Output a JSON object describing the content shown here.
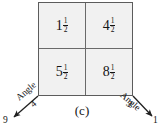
{
  "figure": {
    "caption": "(c)",
    "grid": {
      "rows": [
        [
          {
            "whole": "1",
            "numerator": "1",
            "denominator": "2"
          },
          {
            "whole": "4",
            "numerator": "1",
            "denominator": "2"
          }
        ],
        [
          {
            "whole": "5",
            "numerator": "1",
            "denominator": "2"
          },
          {
            "whole": "8",
            "numerator": "1",
            "denominator": "2"
          }
        ]
      ]
    },
    "axes": {
      "left": {
        "label": "Angle",
        "near_value": "4",
        "far_value": "9"
      },
      "right": {
        "label": "Angle",
        "near_value": "3",
        "far_value": "1"
      }
    },
    "colors": {
      "cell_fill": "#f1f1f1",
      "border": "#5c5c5c",
      "divider": "#6a6a6a",
      "text": "#141414",
      "background": "#ffffff"
    }
  }
}
